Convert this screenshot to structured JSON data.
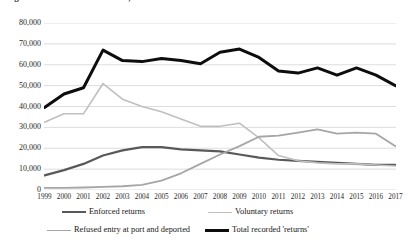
{
  "title": "Figure 1: Returns from the UK, 1999-2017",
  "chart_data": {
    "type": "line",
    "title": "Figure 1: Returns from the UK, 1999-2017",
    "xlabel": "",
    "ylabel": "",
    "x": [
      1999,
      2000,
      2001,
      2002,
      2003,
      2004,
      2005,
      2006,
      2007,
      2008,
      2009,
      2010,
      2011,
      2012,
      2013,
      2014,
      2015,
      2016,
      2017
    ],
    "categories": [
      "1999",
      "2000",
      "2001",
      "2002",
      "2003",
      "2004",
      "2005",
      "2006",
      "2007",
      "2008",
      "2009",
      "2010",
      "2011",
      "2012",
      "2013",
      "2014",
      "2015",
      "2016",
      "2017"
    ],
    "ylim": [
      0,
      80000
    ],
    "yticks": [
      0,
      10000,
      20000,
      30000,
      40000,
      50000,
      60000,
      70000,
      80000
    ],
    "ytick_labels": [
      "0",
      "10,000",
      "20,000",
      "30,000",
      "40,000",
      "50,000",
      "60,000",
      "70,000",
      "80,000"
    ],
    "grid": true,
    "legend_position": "bottom",
    "series": [
      {
        "name": "Enforced returns",
        "color": "#595959",
        "width": 2.2,
        "values": [
          7000,
          9500,
          12500,
          16500,
          19000,
          20500,
          20500,
          19500,
          19000,
          18500,
          17000,
          15500,
          14500,
          14000,
          13500,
          13000,
          12500,
          12000,
          12000
        ]
      },
      {
        "name": "Voluntary returns",
        "color": "#bfbfbf",
        "width": 1.6,
        "values": [
          32500,
          36500,
          36500,
          51000,
          43500,
          40000,
          37500,
          34000,
          30500,
          30500,
          32000,
          25000,
          16500,
          14000,
          13000,
          12500,
          12500,
          12000,
          11500
        ]
      },
      {
        "name": "Refused entry at port and deported",
        "color": "#a6a6a6",
        "width": 1.8,
        "values": [
          1000,
          1000,
          1200,
          1500,
          1800,
          2500,
          4500,
          8000,
          12500,
          17000,
          21000,
          25500,
          26000,
          27500,
          29000,
          27000,
          27500,
          27000,
          21000
        ]
      },
      {
        "name": "Total recorded 'returns'",
        "color": "#0d0d0d",
        "width": 3.0,
        "values": [
          39500,
          46000,
          49000,
          67000,
          62000,
          61500,
          63000,
          62000,
          60500,
          66000,
          67500,
          63500,
          57000,
          56000,
          58500,
          55000,
          58500,
          55000,
          50000
        ]
      }
    ]
  },
  "legend": {
    "items": [
      {
        "label": "Enforced returns",
        "color": "#595959",
        "width": 2.2
      },
      {
        "label": "Voluntary returns",
        "color": "#bfbfbf",
        "width": 1.6
      },
      {
        "label": "Refused entry at port and deported",
        "color": "#a6a6a6",
        "width": 1.8
      },
      {
        "label": "Total recorded 'returns'",
        "color": "#0d0d0d",
        "width": 3.0
      }
    ]
  },
  "axis": {
    "gridline_color": "#d9d9d9",
    "tick_color": "#1f1f1f"
  }
}
